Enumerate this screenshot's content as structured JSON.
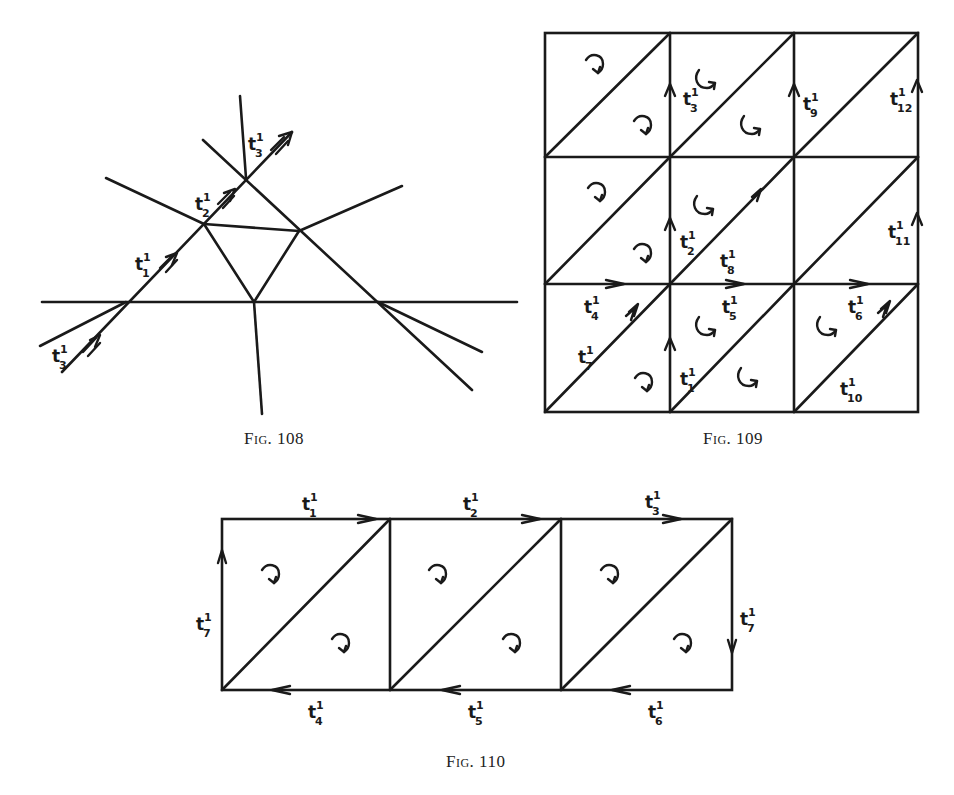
{
  "figures": [
    {
      "id": "fig108",
      "caption": "Fig. 108",
      "labels": [
        {
          "base": "t",
          "sup": "1",
          "sub": "3",
          "x": 248,
          "y": 150
        },
        {
          "base": "t",
          "sup": "1",
          "sub": "2",
          "x": 195,
          "y": 210
        },
        {
          "base": "t",
          "sup": "1",
          "sub": "1",
          "x": 135,
          "y": 270
        },
        {
          "base": "t",
          "sup": "1",
          "sub": "3",
          "x": 52,
          "y": 362
        }
      ]
    },
    {
      "id": "fig109",
      "caption": "Fig. 109",
      "labels": [
        {
          "base": "t",
          "sup": "1",
          "sub": "3",
          "x": 683,
          "y": 105
        },
        {
          "base": "t",
          "sup": "1",
          "sub": "9",
          "x": 803,
          "y": 110
        },
        {
          "base": "t",
          "sup": "1",
          "sub": "12",
          "x": 890,
          "y": 105
        },
        {
          "base": "t",
          "sup": "1",
          "sub": "2",
          "x": 680,
          "y": 248
        },
        {
          "base": "t",
          "sup": "1",
          "sub": "8",
          "x": 720,
          "y": 267
        },
        {
          "base": "t",
          "sup": "1",
          "sub": "11",
          "x": 888,
          "y": 238
        },
        {
          "base": "t",
          "sup": "1",
          "sub": "4",
          "x": 584,
          "y": 313
        },
        {
          "base": "t",
          "sup": "1",
          "sub": "5",
          "x": 722,
          "y": 313
        },
        {
          "base": "t",
          "sup": "1",
          "sub": "6",
          "x": 848,
          "y": 313
        },
        {
          "base": "t",
          "sup": "1",
          "sub": "7",
          "x": 578,
          "y": 363
        },
        {
          "base": "t",
          "sup": "1",
          "sub": "1",
          "x": 680,
          "y": 385
        },
        {
          "base": "t",
          "sup": "1",
          "sub": "10",
          "x": 840,
          "y": 395
        }
      ]
    },
    {
      "id": "fig110",
      "caption": "Fig. 110",
      "labels": [
        {
          "base": "t",
          "sup": "1",
          "sub": "1",
          "x": 302,
          "y": 510
        },
        {
          "base": "t",
          "sup": "1",
          "sub": "2",
          "x": 463,
          "y": 510
        },
        {
          "base": "t",
          "sup": "1",
          "sub": "3",
          "x": 645,
          "y": 508
        },
        {
          "base": "t",
          "sup": "1",
          "sub": "7",
          "x": 196,
          "y": 630
        },
        {
          "base": "t",
          "sup": "1",
          "sub": "7",
          "x": 740,
          "y": 625
        },
        {
          "base": "t",
          "sup": "1",
          "sub": "4",
          "x": 308,
          "y": 718
        },
        {
          "base": "t",
          "sup": "1",
          "sub": "5",
          "x": 468,
          "y": 718
        },
        {
          "base": "t",
          "sup": "1",
          "sub": "6",
          "x": 648,
          "y": 718
        }
      ]
    }
  ]
}
